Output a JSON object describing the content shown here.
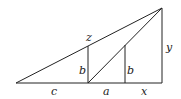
{
  "diagram": {
    "labels": {
      "z": "z",
      "b_left": "b",
      "b_right": "b",
      "y": "y",
      "c": "c",
      "a": "a",
      "x": "x"
    },
    "points": {
      "left": [
        16,
        83
      ],
      "foot1": [
        88,
        83
      ],
      "foot2": [
        125,
        83
      ],
      "foot3": [
        162,
        83
      ],
      "top1": [
        88,
        46
      ],
      "top2": [
        125,
        46
      ],
      "apex": [
        162,
        8
      ]
    },
    "color": "#222222"
  }
}
